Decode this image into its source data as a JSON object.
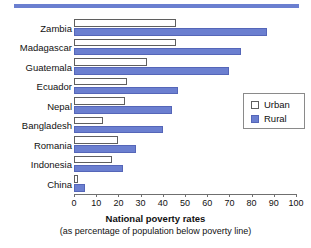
{
  "chart_data": {
    "type": "bar",
    "orientation": "horizontal",
    "title": "National poverty rates",
    "subtitle": "(as percentage of population below poverty line)",
    "xlabel": "",
    "ylabel": "",
    "xlim": [
      0,
      100
    ],
    "xticks": [
      0,
      10,
      20,
      30,
      40,
      50,
      60,
      70,
      80,
      90,
      100
    ],
    "xtick_labels": [
      "0",
      "10",
      "20",
      "30",
      "40",
      "50",
      "60",
      "70",
      "80",
      "90",
      "100"
    ],
    "grid": false,
    "legend_position": "right-middle",
    "categories": [
      "Zambia",
      "Madagascar",
      "Guatemala",
      "Ecuador",
      "Nepal",
      "Bangladesh",
      "Romania",
      "Indonesia",
      "China"
    ],
    "series": [
      {
        "name": "Urban",
        "color": "#ffffff",
        "edge_color": "#5f5f5f",
        "values": [
          46,
          46,
          33,
          24,
          23,
          13,
          20,
          17,
          2
        ]
      },
      {
        "name": "Rural",
        "color": "#6b7fd0",
        "edge_color": "#5566b8",
        "values": [
          87,
          75,
          70,
          47,
          44,
          40,
          28,
          22,
          5
        ]
      }
    ]
  },
  "legend": {
    "items": [
      {
        "label": "Urban",
        "swatch": "urban-swatch"
      },
      {
        "label": "Rural",
        "swatch": "rural-swatch"
      }
    ]
  },
  "colors": {
    "accent": "#6b7fd0",
    "rule": "#6b7fd0",
    "axis": "#6f6f6f",
    "text": "#111111"
  }
}
